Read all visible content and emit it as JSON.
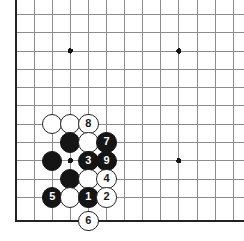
{
  "figure": {
    "kind": "go-board-diagram",
    "board_size": 19,
    "view": "bottom-left corner, cropped",
    "colors": {
      "background": "#ffffff",
      "grid_line": "#8c8c8c",
      "border_line": "#222222",
      "black_stone": "#151515",
      "white_stone": "#ffffff",
      "white_stone_outline": "#222222",
      "star_point": "#151515"
    }
  },
  "board": {
    "grid": {
      "x_positions": [
        16,
        34.1,
        52.2,
        70.3,
        88.4,
        106.5,
        124.6,
        142.7,
        160.8,
        178.9,
        197.0,
        215.1,
        233.2
      ],
      "y_positions": [
        14,
        32.7,
        51.0,
        69.3,
        87.6,
        105.9,
        124.2,
        142.5,
        160.8,
        179.1,
        197.4,
        221.0
      ],
      "left_border_x": 16,
      "bottom_border_y": 221,
      "cell": 18.1,
      "line_width": 1,
      "border_width": 2.6
    },
    "star_points": [
      {
        "x": 70.3,
        "y": 51.0
      },
      {
        "x": 178.9,
        "y": 51.0
      },
      {
        "x": 178.9,
        "y": 160.8
      },
      {
        "x": 70.3,
        "y": 160.8
      }
    ],
    "star_radius": 2.6
  },
  "stones": {
    "radius": 10.2,
    "label_font_size": 11,
    "list": [
      {
        "id": "w-a",
        "color": "white",
        "label": "",
        "x": 52.2,
        "y": 124.2
      },
      {
        "id": "w-b",
        "color": "white",
        "label": "",
        "x": 70.3,
        "y": 124.2
      },
      {
        "id": "w-8",
        "color": "white",
        "label": "8",
        "x": 88.4,
        "y": 124.2
      },
      {
        "id": "b-a",
        "color": "black",
        "label": "",
        "x": 70.3,
        "y": 142.5
      },
      {
        "id": "w-c",
        "color": "white",
        "label": "",
        "x": 88.4,
        "y": 142.5
      },
      {
        "id": "b-7",
        "color": "black",
        "label": "7",
        "x": 106.5,
        "y": 142.5
      },
      {
        "id": "b-b",
        "color": "black",
        "label": "",
        "x": 52.2,
        "y": 160.8
      },
      {
        "id": "b-3",
        "color": "black",
        "label": "3",
        "x": 88.4,
        "y": 160.8
      },
      {
        "id": "b-9",
        "color": "black",
        "label": "9",
        "x": 106.5,
        "y": 160.8
      },
      {
        "id": "b-c",
        "color": "black",
        "label": "",
        "x": 70.3,
        "y": 179.1
      },
      {
        "id": "w-d",
        "color": "white",
        "label": "",
        "x": 88.4,
        "y": 179.1
      },
      {
        "id": "w-4",
        "color": "white",
        "label": "4",
        "x": 106.5,
        "y": 179.1
      },
      {
        "id": "b-5",
        "color": "black",
        "label": "5",
        "x": 52.2,
        "y": 197.4
      },
      {
        "id": "w-e",
        "color": "white",
        "label": "",
        "x": 70.3,
        "y": 197.4
      },
      {
        "id": "b-1",
        "color": "black",
        "label": "1",
        "x": 88.4,
        "y": 197.4
      },
      {
        "id": "w-2",
        "color": "white",
        "label": "2",
        "x": 106.5,
        "y": 197.4
      },
      {
        "id": "w-6",
        "color": "white",
        "label": "6",
        "x": 88.4,
        "y": 221.0
      }
    ]
  },
  "move_sequence": [
    {
      "move": "1",
      "color": "black"
    },
    {
      "move": "2",
      "color": "white"
    },
    {
      "move": "3",
      "color": "black"
    },
    {
      "move": "4",
      "color": "white"
    },
    {
      "move": "5",
      "color": "black"
    },
    {
      "move": "6",
      "color": "white"
    },
    {
      "move": "7",
      "color": "black"
    },
    {
      "move": "8",
      "color": "white"
    },
    {
      "move": "9",
      "color": "black"
    }
  ]
}
